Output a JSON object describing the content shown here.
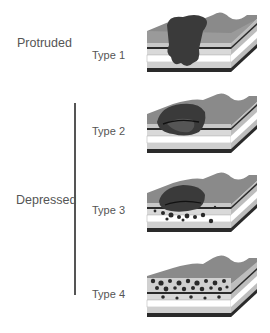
{
  "groups": {
    "protruded": "Protruded",
    "depressed": "Depressed"
  },
  "types": [
    {
      "label": "Type 1",
      "group": "Protruded",
      "lesion": "protruded mass above surface, penetrating layers"
    },
    {
      "label": "Type 2",
      "group": "Depressed",
      "lesion": "ulcerated depression with raised margin"
    },
    {
      "label": "Type 3",
      "group": "Depressed",
      "lesion": "ulcerated depression with infiltrating nodules"
    },
    {
      "label": "Type 4",
      "group": "Depressed",
      "lesion": "diffuse infiltration within wall layers"
    }
  ],
  "colors": {
    "surface": "#8a8a8a",
    "lesion": "#3a3a3a",
    "layer_light": "#d9d9d9",
    "layer_white": "#ffffff",
    "layer_dark": "#2a2a2a",
    "line": "#555555"
  }
}
